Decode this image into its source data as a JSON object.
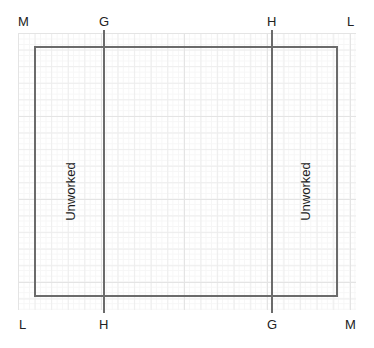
{
  "figure": {
    "title": "",
    "background_color": "#ffffff",
    "grid_color": "#ededed",
    "line_color": "#6b6b6b",
    "text_color": "#222222",
    "top_labels": [
      {
        "name": "top-left-vertex",
        "text": "M"
      },
      {
        "name": "top-division-left",
        "text": "G"
      },
      {
        "name": "top-division-right",
        "text": "H"
      },
      {
        "name": "top-right-vertex",
        "text": "L"
      }
    ],
    "bottom_labels": [
      {
        "name": "bottom-left-vertex",
        "text": "L"
      },
      {
        "name": "bottom-division-left",
        "text": "H"
      },
      {
        "name": "bottom-division-right",
        "text": "G"
      },
      {
        "name": "bottom-right-vertex",
        "text": "M"
      }
    ],
    "regions": [
      {
        "name": "left-strip",
        "text": "Unworked"
      },
      {
        "name": "right-strip",
        "text": "Unworked"
      }
    ]
  },
  "chart_data": {
    "type": "diagram",
    "title": "",
    "xlabel": "",
    "ylabel": "",
    "grid": true,
    "shapes": [
      {
        "kind": "rectangle",
        "name": "main-rectangle",
        "x": 34,
        "y": 46,
        "width": 304,
        "height": 251,
        "stroke": "#6b6b6b",
        "stroke_width": 2,
        "fill": "none"
      },
      {
        "kind": "line",
        "name": "vertical-division-left",
        "x1": 104,
        "y1": 30,
        "x2": 104,
        "y2": 313,
        "stroke": "#6b6b6b",
        "stroke_width": 2
      },
      {
        "kind": "line",
        "name": "vertical-division-right",
        "x1": 272,
        "y1": 30,
        "x2": 272,
        "y2": 313,
        "stroke": "#6b6b6b",
        "stroke_width": 2
      }
    ],
    "annotations": [
      {
        "text": "M",
        "x": 24,
        "y": 22,
        "position": "top"
      },
      {
        "text": "G",
        "x": 104,
        "y": 22,
        "position": "top"
      },
      {
        "text": "H",
        "x": 272,
        "y": 22,
        "position": "top"
      },
      {
        "text": "L",
        "x": 352,
        "y": 22,
        "position": "top"
      },
      {
        "text": "L",
        "x": 24,
        "y": 327,
        "position": "bottom"
      },
      {
        "text": "H",
        "x": 104,
        "y": 327,
        "position": "bottom"
      },
      {
        "text": "G",
        "x": 272,
        "y": 327,
        "position": "bottom"
      },
      {
        "text": "M",
        "x": 352,
        "y": 327,
        "position": "bottom"
      },
      {
        "text": "Unworked",
        "x": 69,
        "y": 188,
        "rotation": -90
      },
      {
        "text": "Unworked",
        "x": 305,
        "y": 188,
        "rotation": -90
      }
    ]
  }
}
